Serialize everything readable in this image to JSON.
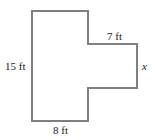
{
  "diagram": {
    "type": "floor-plan-shape",
    "line_color": "#808080",
    "labels": {
      "left": "15 ft",
      "top_right": "7 ft",
      "right": "x",
      "bottom": "8 ft"
    }
  }
}
